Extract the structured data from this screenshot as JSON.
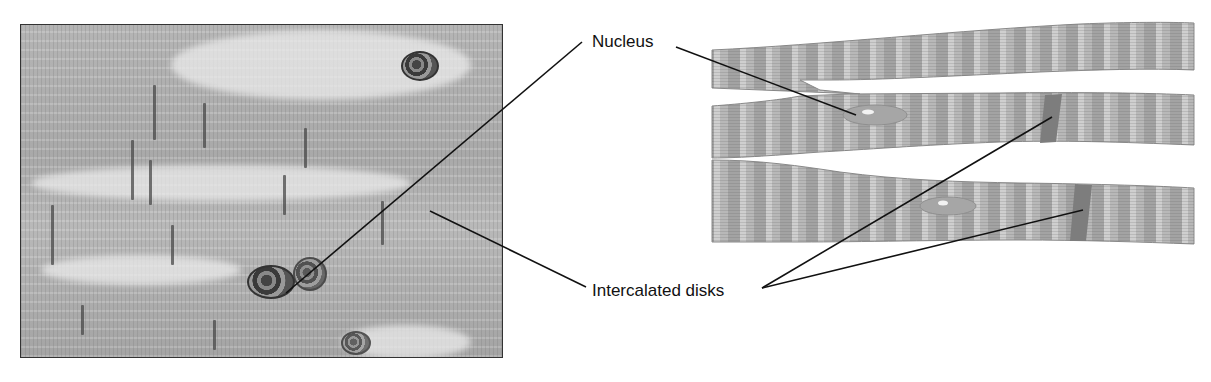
{
  "figure": {
    "left_panel": {
      "kind": "light-micrograph",
      "subject": "cardiac muscle tissue"
    },
    "right_panel": {
      "kind": "illustration",
      "subject": "branching cardiac muscle fibers"
    },
    "labels": {
      "nucleus": "Nucleus",
      "intercalated_disks": "Intercalated disks"
    },
    "colors": {
      "background": "#ffffff",
      "fiber_fill": "#b3b3b3",
      "fiber_band_dark": "#9a9a9a",
      "intercalated_disk": "#7d7d7d",
      "nucleus_fill": "#a6a6a6",
      "leader_line": "#111111"
    }
  }
}
